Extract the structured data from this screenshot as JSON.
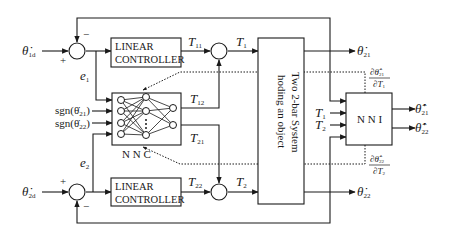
{
  "diagram": {
    "inputs": {
      "theta1d": {
        "symbol": "θ̇",
        "sub": "1d"
      },
      "theta2d": {
        "symbol": "θ̇",
        "sub": "2d"
      }
    },
    "signs": {
      "plus": "+",
      "minus": "−"
    },
    "errors": {
      "e1": {
        "symbol": "e",
        "sub": "1"
      },
      "e2": {
        "symbol": "e",
        "sub": "2"
      }
    },
    "blocks": {
      "linear_controller_1": {
        "line1": "LINEAR",
        "line2": "CONTROLLER"
      },
      "linear_controller_2": {
        "line1": "LINEAR",
        "line2": "CONTROLLER"
      },
      "nnc": {
        "label": "N N C"
      },
      "system": {
        "line1": "Two 2-bar System",
        "line2": "hoding an object"
      },
      "nni": {
        "label": "N N I"
      }
    },
    "nnc_inputs": {
      "sgn1": "sgn(θ̇",
      "sgn1_sub": "21",
      "sgn2": "sgn(θ̇",
      "sgn2_sub": "22",
      "close": ")"
    },
    "torques": {
      "T11": {
        "symbol": "T",
        "sub": "11"
      },
      "T12": {
        "symbol": "T",
        "sub": "12"
      },
      "T21": {
        "symbol": "T",
        "sub": "21"
      },
      "T22": {
        "symbol": "T",
        "sub": "22"
      },
      "T1": {
        "symbol": "T",
        "sub": "1"
      },
      "T2": {
        "symbol": "T",
        "sub": "2"
      }
    },
    "outputs": {
      "theta21": {
        "symbol": "θ̇",
        "sub": "21"
      },
      "theta22": {
        "symbol": "θ̇",
        "sub": "22"
      },
      "theta21_hat": {
        "symbol": "θ̂̇",
        "sub": "21"
      },
      "theta22_hat": {
        "symbol": "θ̂̇",
        "sub": "22"
      }
    },
    "jacobians": {
      "j1": {
        "num": "∂θ̂̇",
        "num_sub": "21",
        "den": "∂T",
        "den_sub": "1"
      },
      "j2": {
        "num": "∂θ̂̇",
        "num_sub": "22",
        "den": "∂T",
        "den_sub": "2"
      }
    },
    "colors": {
      "line": "#1a1a1a",
      "background": "#ffffff"
    }
  }
}
